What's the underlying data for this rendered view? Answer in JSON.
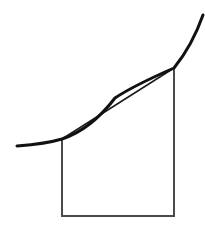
{
  "figure": {
    "title": "Trapezoidal rule approximation diagram",
    "canvas": {
      "width": 205,
      "height": 231,
      "background": "#ffffff"
    },
    "colors": {
      "curve": "#111111",
      "chord": "#1a1a1a",
      "trapezoid": "#4a4a4a"
    },
    "elements": {
      "curve": {
        "label": "function-curve",
        "stroke_width": 3.0,
        "stroke": "#111111",
        "path": "M 17,146 C 36,144.5 52,142 62,139 C 86,131 102,115 115,98 C 133,86 158,75 174,68 C 187,52 197,32 203,15",
        "points": [
          {
            "x": 17,
            "y": 146
          },
          {
            "x": 62,
            "y": 139
          },
          {
            "x": 115,
            "y": 98
          },
          {
            "x": 174,
            "y": 68
          },
          {
            "x": 203,
            "y": 15
          }
        ]
      },
      "chord": {
        "label": "chord-secant-line",
        "stroke_width": 1.5,
        "stroke": "#1a1a1a",
        "x1": 62,
        "y1": 139,
        "x2": 174,
        "y2": 68
      },
      "trapezoid": {
        "label": "trapezoid-region",
        "stroke_width": 2.0,
        "stroke": "#4a4a4a",
        "fill": "none",
        "left_x": 62,
        "right_x": 174,
        "base_y": 216,
        "left_top_y": 139,
        "right_top_y": 68,
        "path": "M 62,139 L 62,216 L 174,216 L 174,68"
      }
    }
  }
}
